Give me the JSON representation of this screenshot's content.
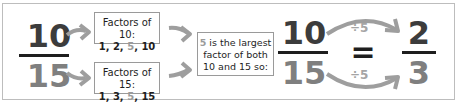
{
  "fraction_start": {
    "numerator": "10",
    "denominator": "15"
  },
  "factors_box_top": {
    "title": "Factors of 10:",
    "list_parts": [
      "1, 2, ",
      "5",
      ", 10"
    ]
  },
  "factors_box_bottom": {
    "title": "Factors of 15:",
    "list_parts": [
      "1, 3, ",
      "5",
      ", 15"
    ]
  },
  "conclusion_box": {
    "highlight": "5",
    "line1_rest": " is the largest",
    "line2": "factor of both",
    "line3": "10 and 15 so:"
  },
  "fraction_mid": {
    "numerator": "10",
    "denominator": "15"
  },
  "operation_top": "÷5",
  "operation_bottom": "÷5",
  "equals": "=",
  "fraction_result": {
    "numerator": "2",
    "denominator": "3"
  },
  "colors": {
    "dark_text": "#3c3c3c",
    "grey_text": "#7f7f7f",
    "arrow": "#9e9e9e",
    "border": "#bdbdbd",
    "highlight": "#9a9a9a"
  }
}
